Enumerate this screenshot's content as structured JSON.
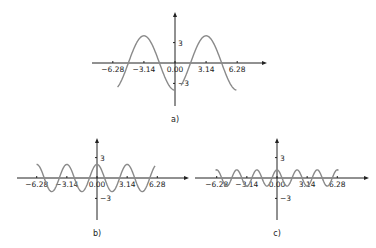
{
  "chart_data": [
    {
      "type": "line",
      "panel_label": "a)",
      "title": "",
      "xlabel": "",
      "ylabel": "",
      "x_ticks": [
        "−6.28",
        "−3.14",
        "0.00",
        "3.14",
        "6.28"
      ],
      "x_tick_values": [
        -6.28,
        -3.14,
        0,
        3.14,
        6.28
      ],
      "y_ticks": [
        "3",
        "−3"
      ],
      "y_tick_values": [
        3,
        -3
      ],
      "grid": false,
      "legend": null,
      "series": [
        {
          "name": "segment-left",
          "function": "-4*cos(x)",
          "x_range": [
            -5.8,
            0.0
          ]
        },
        {
          "name": "segment-right",
          "function": "-4*cos(x)",
          "x_range": [
            0.6,
            6.2
          ]
        }
      ],
      "layout": {
        "origin": [
          175,
          63
        ],
        "px_per_x": 9.9,
        "px_per_y": 6.8,
        "x_axis": [
          92,
          264
        ],
        "y_axis": [
          15,
          106
        ]
      }
    },
    {
      "type": "line",
      "panel_label": "b)",
      "title": "",
      "xlabel": "",
      "ylabel": "",
      "x_ticks": [
        "−6.28",
        "−3.14",
        "0.00",
        "3.14",
        "6.28"
      ],
      "x_tick_values": [
        -6.28,
        -3.14,
        0,
        3.14,
        6.28
      ],
      "y_ticks": [
        "3",
        "−3"
      ],
      "y_tick_values": [
        3,
        -3
      ],
      "grid": false,
      "legend": null,
      "series": [
        {
          "name": "curve",
          "function": "2*cos(2*x)",
          "x_range": [
            -6.3,
            6.05
          ]
        }
      ],
      "layout": {
        "origin": [
          97,
          178
        ],
        "px_per_x": 9.6,
        "px_per_y": 6.8,
        "x_axis": [
          17,
          186
        ],
        "y_axis": [
          141,
          220
        ]
      }
    },
    {
      "type": "line",
      "panel_label": "c)",
      "title": "",
      "xlabel": "",
      "ylabel": "",
      "x_ticks": [
        "−6.28",
        "−3.14",
        "0.00",
        "3.14",
        "6.28"
      ],
      "x_tick_values": [
        -6.28,
        -3.14,
        0,
        3.14,
        6.28
      ],
      "y_ticks": [
        "3",
        "−3"
      ],
      "y_tick_values": [
        3,
        -3
      ],
      "grid": false,
      "legend": null,
      "series": [
        {
          "name": "curve",
          "function": "1.2*cos(3*x)",
          "x_range": [
            -6.4,
            6.4
          ]
        }
      ],
      "layout": {
        "origin": [
          277,
          178
        ],
        "px_per_x": 9.6,
        "px_per_y": 6.8,
        "x_axis": [
          195,
          366
        ],
        "y_axis": [
          141,
          220
        ]
      }
    }
  ]
}
